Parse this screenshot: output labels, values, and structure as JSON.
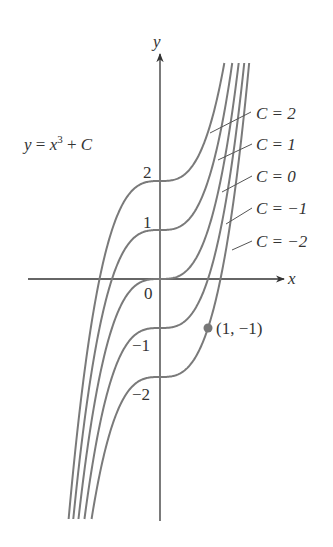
{
  "chart_data": {
    "type": "line",
    "title": "",
    "equation_label": "y = x³ + C",
    "equation": {
      "y": "y",
      "eq": " = ",
      "x": "x",
      "exp": "3",
      "plus": " + ",
      "c": "C"
    },
    "xlabel": "x",
    "ylabel": "y",
    "origin_label": "0",
    "y_ticks": [
      {
        "value": 2,
        "label": "2"
      },
      {
        "value": 1,
        "label": "1"
      },
      {
        "value": -1,
        "label": "−1"
      },
      {
        "value": -2,
        "label": "−2"
      }
    ],
    "xlim": [
      -2.75,
      2.6
    ],
    "ylim": [
      -4.95,
      4.6
    ],
    "grid": false,
    "legend_position": "right (leader-line annotations)",
    "series": [
      {
        "name": "C = 2",
        "C": 2,
        "label": "C = 2"
      },
      {
        "name": "C = 1",
        "C": 1,
        "label": "C = 1"
      },
      {
        "name": "C = 0",
        "C": 0,
        "label": "C = 0"
      },
      {
        "name": "C = -1",
        "C": -1,
        "label": "C = −1"
      },
      {
        "name": "C = -2",
        "C": -2,
        "label": "C = −2"
      }
    ],
    "highlight_point": {
      "x": 1,
      "y": -1,
      "label": "(1, −1)",
      "series": "C = -2"
    }
  },
  "colors": {
    "curve": "#7a7a7a",
    "axis": "#333333",
    "point": "#777777",
    "text": "#333333"
  }
}
